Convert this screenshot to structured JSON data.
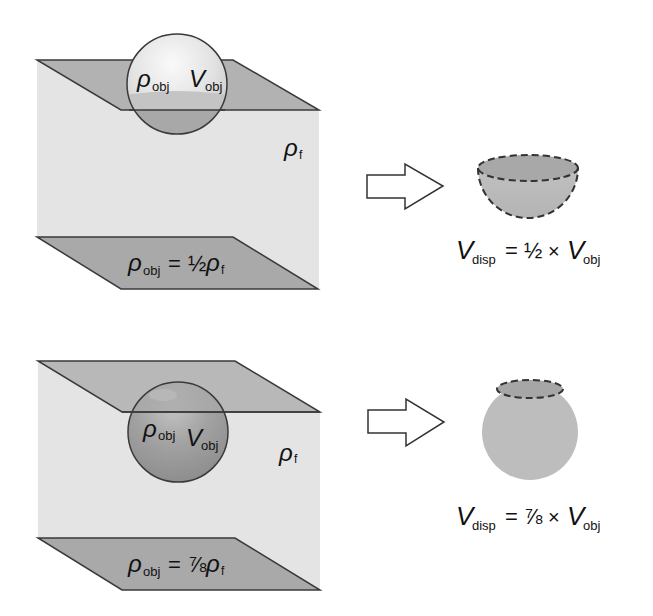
{
  "colors": {
    "background": "#ffffff",
    "fluid_face": "#e4e4e4",
    "plane_fill": "#a9a9a9",
    "plane_stroke": "#3a3a3a",
    "sphere_light_top": "#f2f2f2",
    "sphere_light_mid": "#d8d8d8",
    "sphere_submerged": "#a4a4a4",
    "sphere_dense": "#9c9c9c",
    "displaced_fill": "#bdbdbd",
    "outline": "#333333"
  },
  "panels": [
    {
      "id": "half",
      "sphere_label": {
        "rho": "ρ",
        "rho_sub": "obj",
        "vol": "V",
        "vol_sub": "obj"
      },
      "fluid_label": {
        "rho": "ρ",
        "sub": "f"
      },
      "density_relation": {
        "lhs": "ρ",
        "lhs_sub": "obj",
        "eq": "=",
        "fraction": "½",
        "rhs": "ρ",
        "rhs_sub": "f"
      },
      "arrow_icon": "right-arrow-outline",
      "displaced_shape": "hemisphere",
      "displaced_formula": {
        "v": "V",
        "v_sub": "disp",
        "eq": "=",
        "fraction": "½",
        "times": "×",
        "v2": "V",
        "v2_sub": "obj"
      }
    },
    {
      "id": "seven-eighths",
      "sphere_label": {
        "rho": "ρ",
        "rho_sub": "obj",
        "vol": "V",
        "vol_sub": "obj"
      },
      "fluid_label": {
        "rho": "ρ",
        "sub": "f"
      },
      "density_relation": {
        "lhs": "ρ",
        "lhs_sub": "obj",
        "eq": "=",
        "fraction": "⅞",
        "rhs": "ρ",
        "rhs_sub": "f"
      },
      "arrow_icon": "right-arrow-outline",
      "displaced_shape": "sphere-with-cap-removed",
      "displaced_formula": {
        "v": "V",
        "v_sub": "disp",
        "eq": "=",
        "fraction": "⅞",
        "times": "×",
        "v2": "V",
        "v2_sub": "obj"
      }
    }
  ]
}
